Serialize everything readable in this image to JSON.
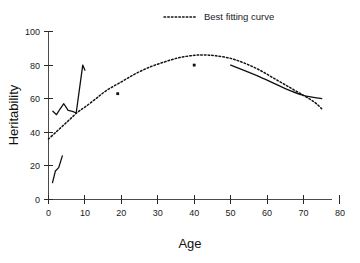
{
  "chart_data": {
    "type": "line",
    "title": "",
    "xlabel": "Age",
    "ylabel": "Heritability",
    "xlim": [
      0,
      80
    ],
    "ylim": [
      0,
      100
    ],
    "xticks": [
      0,
      10,
      20,
      30,
      40,
      50,
      60,
      70,
      80
    ],
    "yticks": [
      0,
      20,
      40,
      60,
      80,
      100
    ],
    "xtick_labels": [
      "0",
      "10",
      "20",
      "30",
      "40",
      "50",
      "60",
      "70",
      "80"
    ],
    "ytick_labels": [
      "0",
      "20",
      "40",
      "60",
      "80",
      "100"
    ],
    "grid": false,
    "legend_position": "top-center",
    "legend": [
      {
        "name": "Best fitting curve",
        "style": "dotted"
      }
    ],
    "series": [
      {
        "name": "Best fitting curve",
        "style": "dotted",
        "points": [
          [
            0,
            36
          ],
          [
            2,
            40
          ],
          [
            4,
            44
          ],
          [
            6,
            48
          ],
          [
            8,
            52
          ],
          [
            10,
            55
          ],
          [
            13,
            60
          ],
          [
            16,
            65
          ],
          [
            20,
            70
          ],
          [
            24,
            75
          ],
          [
            28,
            79
          ],
          [
            32,
            82
          ],
          [
            36,
            84.5
          ],
          [
            40,
            85.8
          ],
          [
            43,
            86
          ],
          [
            46,
            85.5
          ],
          [
            50,
            84
          ],
          [
            54,
            81
          ],
          [
            58,
            77
          ],
          [
            62,
            72
          ],
          [
            66,
            67
          ],
          [
            70,
            62
          ],
          [
            73,
            58
          ],
          [
            75,
            54
          ]
        ]
      },
      {
        "name": "Young children zigzag series",
        "style": "solid",
        "points": [
          [
            1.2,
            52.5
          ],
          [
            2.2,
            50.5
          ],
          [
            3.2,
            54
          ],
          [
            4.2,
            57
          ],
          [
            5.4,
            53
          ],
          [
            6.6,
            52.5
          ],
          [
            7.6,
            51.5
          ],
          [
            9.4,
            80
          ],
          [
            10.0,
            77
          ]
        ]
      },
      {
        "name": "Low early-childhood series",
        "style": "solid",
        "points": [
          [
            1.1,
            10
          ],
          [
            1.9,
            17
          ],
          [
            2.8,
            19
          ],
          [
            3.8,
            26
          ]
        ]
      },
      {
        "name": "Older adults series",
        "style": "solid",
        "points": [
          [
            50,
            80
          ],
          [
            58,
            73
          ],
          [
            65,
            66
          ],
          [
            70,
            62
          ],
          [
            75,
            60
          ]
        ]
      },
      {
        "name": "Individual study estimates",
        "style": "points",
        "points": [
          [
            19,
            63
          ],
          [
            40,
            80
          ]
        ]
      }
    ]
  },
  "legend": {
    "best_fitting_curve": "Best fitting curve"
  },
  "axes": {
    "x_title": "Age",
    "y_title": "Heritability"
  }
}
